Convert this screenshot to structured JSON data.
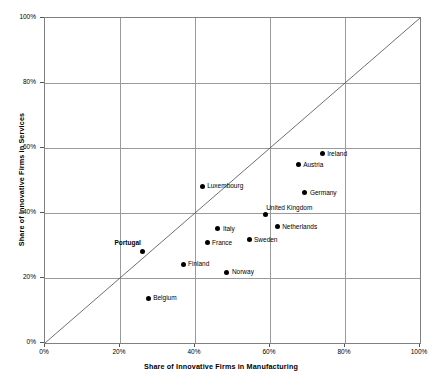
{
  "chart_data": {
    "type": "scatter",
    "title": "",
    "xlabel": "Share of Innovative Firms in Manufacturing",
    "ylabel": "Share of Innovative Firms in Services",
    "xlim": [
      0,
      100
    ],
    "ylim": [
      0,
      100
    ],
    "xticks": [
      "0%",
      "20%",
      "40%",
      "60%",
      "80%",
      "100%"
    ],
    "xtick_values": [
      0,
      20,
      40,
      60,
      80,
      100
    ],
    "yticks": [
      "0%",
      "20%",
      "40%",
      "60%",
      "80%",
      "100%"
    ],
    "ytick_values": [
      0,
      20,
      40,
      60,
      80,
      100
    ],
    "grid": true,
    "legend": "none",
    "annotations": [
      {
        "name": "diagonal-45-degree-reference-line",
        "from": [
          0,
          0
        ],
        "to": [
          100,
          100
        ]
      }
    ],
    "points": [
      {
        "label": "Ireland",
        "x": 73.9,
        "y": 58.2,
        "label_pos": "right",
        "bold": false
      },
      {
        "label": "Austria",
        "x": 67.5,
        "y": 54.8,
        "label_pos": "right",
        "bold": false
      },
      {
        "label": "Germany",
        "x": 69.3,
        "y": 46.2,
        "label_pos": "right",
        "bold": false
      },
      {
        "label": "United Kingdom",
        "x": 58.7,
        "y": 39.4,
        "label_pos": "above-left",
        "bold": false
      },
      {
        "label": "Netherlands",
        "x": 61.9,
        "y": 35.7,
        "label_pos": "right",
        "bold": false
      },
      {
        "label": "Luxembourg",
        "x": 41.9,
        "y": 48.3,
        "label_pos": "right",
        "bold": false
      },
      {
        "label": "Italy",
        "x": 46.1,
        "y": 35.1,
        "label_pos": "right",
        "bold": false
      },
      {
        "label": "France",
        "x": 43.2,
        "y": 30.8,
        "label_pos": "right",
        "bold": false
      },
      {
        "label": "Sweden",
        "x": 54.4,
        "y": 31.7,
        "label_pos": "right",
        "bold": false
      },
      {
        "label": "Finland",
        "x": 36.8,
        "y": 24.3,
        "label_pos": "right",
        "bold": false
      },
      {
        "label": "Norway",
        "x": 48.5,
        "y": 21.8,
        "label_pos": "right",
        "bold": false
      },
      {
        "label": "Portugal",
        "x": 26.1,
        "y": 28.3,
        "label_pos": "above-left",
        "bold": true
      },
      {
        "label": "Belgium",
        "x": 27.5,
        "y": 13.8,
        "label_pos": "right",
        "bold": false
      }
    ]
  },
  "colors": {
    "marker": "#000000",
    "gridline": "#9a9a9a",
    "axis": "#808080",
    "diagonal": "#4a4a4a",
    "background": "#ffffff",
    "text": "#000000"
  }
}
